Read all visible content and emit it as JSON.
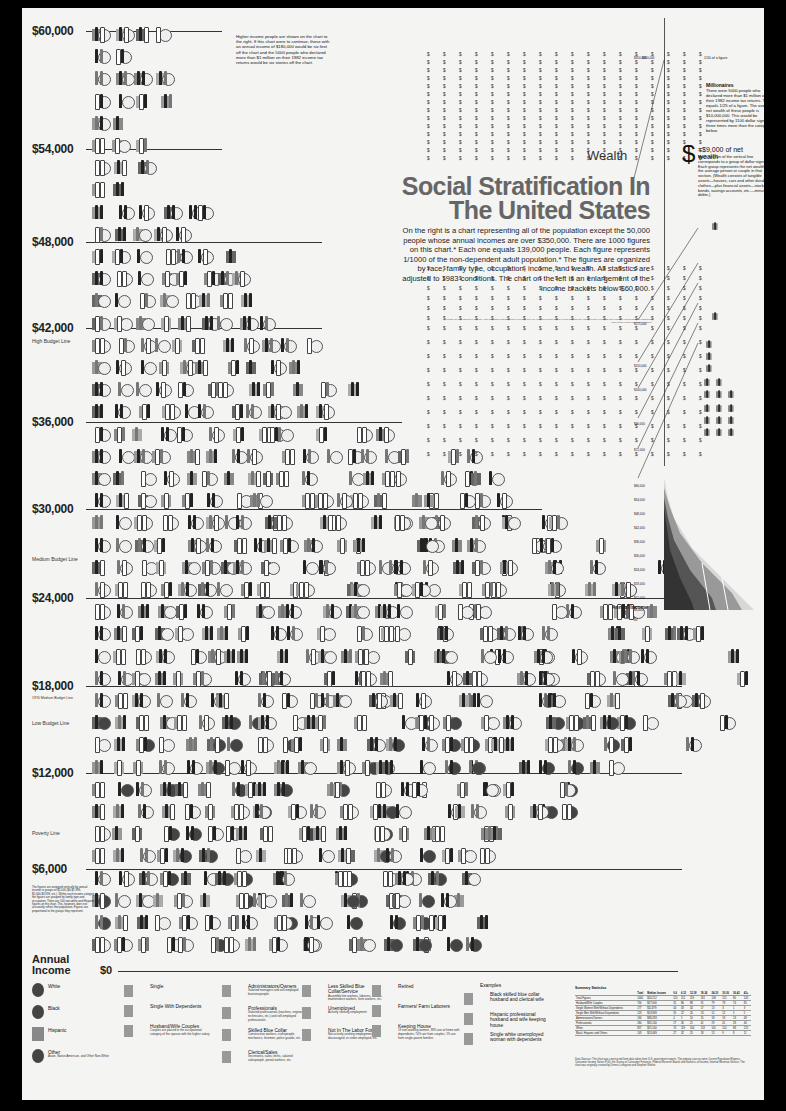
{
  "chart_data": {
    "type": "pictograph",
    "title": "Social Stratification In The United States",
    "subtitle": "On the right is a chart representing all of the population except the 50,000 people whose annual incomes are over $350,000. There are 1000 figures on this chart.* Each one equals 139,000 people. Each figure represents 1/1000 of the non-dependent adult population.* The figures are organized by race, family type, occupation, income, and wealth. All statistics are adjusted to 1983 conditions. The chart on the left is an enlargement of the income brackets below $60,000.",
    "ylabel": "Annual Income",
    "y_ticks": [
      "$0",
      "$6,000",
      "$12,000",
      "$18,000",
      "$24,000",
      "$30,000",
      "$36,000",
      "$42,000",
      "$48,000",
      "$54,000",
      "$60,000"
    ],
    "ylim": [
      0,
      60000
    ],
    "reference_lines": [
      {
        "label": "High Budget Line",
        "value": 41000
      },
      {
        "label": "Medium Budget Line",
        "value": 27000
      },
      {
        "label": "1970 Medium Budget Line",
        "value": 17500
      },
      {
        "label": "Low Budget Line",
        "value": 16500
      },
      {
        "label": "Poverty Line",
        "value": 9500
      }
    ],
    "figures_per_row_by_bracket": [
      {
        "income_row": "$58,000-60,000",
        "count": 4
      },
      {
        "income_row": "$54,000-56,000",
        "count": 4
      },
      {
        "income_row": "$48,000-50,000",
        "count": 7
      },
      {
        "income_row": "$42,000-44,000",
        "count": 10
      },
      {
        "income_row": "$36,000-38,000",
        "count": 12
      },
      {
        "income_row": "$30,000-32,000",
        "count": 17
      },
      {
        "income_row": "$24,000-26,000",
        "count": 22
      },
      {
        "income_row": "$18,000-20,000",
        "count": 25
      },
      {
        "income_row": "$12,000-14,000",
        "count": 28
      },
      {
        "income_row": "$6,000-8,000",
        "count": 24
      },
      {
        "income_row": "$0-2,000",
        "count": 18
      }
    ],
    "wealth_axis_ticks": [
      "$0",
      "$6,000",
      "$12,000",
      "$18,000",
      "$24,000",
      "$30,000",
      "$36,000",
      "$42,000",
      "$48,000",
      "$54,000",
      "$60,000",
      "$72,000",
      "$90,000",
      "$100,000",
      "$150,000",
      "$175,000",
      "$350,000"
    ],
    "wealth_unit": "$ = $9,000 of net wealth"
  },
  "poster": {
    "wealth_label": "Wealth",
    "dollar_row": "$ $ $ $ $ $ $ $ $ $ $ $ $ $ $ $ $ $",
    "top_marker": "$350,000",
    "one_figure_label": "1/10 of a figure",
    "millionaires": {
      "title": "Millionaires",
      "body": "There were 5000 people who declared more than $1 million on their 1982 income tax returns. This equals 1/25 of a figure. The average net wealth of these people is $10,000,000. This would be represented by 1100 dollar signs, or three times more than the category below."
    },
    "net_wealth": {
      "symbol": "$",
      "head": "=$9,000 of net wealth",
      "body": "Each section of the vertical line corresponds to a group of dollar signs. Each group represents the net wealth of the average person or couple in that section. (Wealth consists of tangible assets—houses, cars and other durables, clothes—plus financial assets—stocks, bonds, savings accounts, etc.—minus debts.)"
    },
    "annual_income_right": "Annual Income",
    "wealth_ticks_right": [
      "$350,000",
      "$175,000",
      "$150,000",
      "$100,000",
      "$90,000",
      "$72,000",
      "$60,000",
      "$54,000",
      "$48,000",
      "$42,000",
      "$36,000",
      "$30,000",
      "$24,000",
      "$18,000",
      "$12,000",
      "$6,000",
      "$0"
    ],
    "footnote": "*These are real figures in a couple. Non-dependent adults include everyone over 18 years old except children living with parents; elderly people living with their children; and persons in institutions such as the armed forces and prisons.",
    "side_note_top": "Higher income people are shown on the chart to the right. If this chart were to continue, those with an annual income of $180,000 would be six feet off the chart and the 5000 people who declared more than $1 million on their 1982 income tax returns would be six stories off the chart.",
    "side_note_bottom": "The figures are arranged vertically by annual income in groups of $2,000 ($0-$1,999, $2,000-$3,999, etc.). Within each income category the figures are grouped by family type and occupation. There are 100 non-white and Hispanic figures on the chart. This, however, does not accurately reflect that population. Figures are proportional to the groups they represent.",
    "annual_income_left": "Annual Income",
    "zero_label": "$0",
    "y_labels": [
      {
        "label": "$60,000",
        "top": 16
      },
      {
        "label": "$54,000",
        "top": 134
      },
      {
        "label": "$48,000",
        "top": 227
      },
      {
        "label": "$42,000",
        "top": 313
      },
      {
        "label": "$36,000",
        "top": 407
      },
      {
        "label": "$30,000",
        "top": 494
      },
      {
        "label": "$24,000",
        "top": 583
      },
      {
        "label": "$18,000",
        "top": 671
      },
      {
        "label": "$12,000",
        "top": 758
      },
      {
        "label": "$6,000",
        "top": 854
      }
    ],
    "budget_labels": {
      "high": "High Budget Line",
      "medium": "Medium Budget Line",
      "medium_1970": "1970 Medium Budget Line",
      "low": "Low Budget Line",
      "poverty": "Poverty Line"
    }
  },
  "legend": {
    "race": [
      {
        "label": "White"
      },
      {
        "label": "Black"
      },
      {
        "label": "Hispanic"
      },
      {
        "label": "Other",
        "sub": "Asian, Native American, and Other Non-White"
      }
    ],
    "family": [
      {
        "label": "Single"
      },
      {
        "label": "Single With Dependents"
      },
      {
        "label": "Husband/Wife Couples",
        "sub": "Couples are placed in the occupational category of the spouse with the higher salary"
      }
    ],
    "occupation_a": [
      {
        "label": "Administrators/Owners",
        "sub": "Salaried managers and self-employed businesspeople"
      },
      {
        "label": "Professionals",
        "sub": "Salaried professionals (teachers, engineers, technicians, etc.) and self-employed professionals"
      },
      {
        "label": "Skilled Blue Collar",
        "sub": "Construction workers, craftspeople, mechanics, foremen, police guards, etc."
      },
      {
        "label": "Clerical/Sales",
        "sub": "Secretaries, sales clerks, salaried salespeople, postal workers, etc."
      }
    ],
    "occupation_b": [
      {
        "label": "Less Skilled Blue Collar/Service",
        "sub": "Assembly line workers, laborers, waiters, maintenance workers, farm workers, etc."
      },
      {
        "label": "Unemployed",
        "sub": "Actively seeking employment"
      },
      {
        "label": "Not In The Labor Force",
        "sub": "Not actively seeking employment, discouraged, or under-employed, etc."
      }
    ],
    "other": [
      {
        "label": "Retired"
      },
      {
        "label": "Farmers/ Farm Laborers"
      },
      {
        "label": "Keeping House",
        "sub": "Of non-working women, 38% are at home with dependents; 74% are from couples; 1% are from single-parent families"
      }
    ],
    "examples": {
      "title": "Examples",
      "items": [
        {
          "label": "Black skilled blue collar husband and clerical wife"
        },
        {
          "label": "Hispanic professional husband and wife keeping house"
        },
        {
          "label": "Single white unemployed woman with dependents"
        }
      ]
    }
  },
  "summary": {
    "title": "Summary Statistics",
    "headers": [
      "",
      "Total",
      "Median Income",
      "0-6",
      "6-12",
      "12-18",
      "18-24",
      "24-30",
      "30-36",
      "36-42",
      "42+"
    ],
    "rows": [
      [
        "Total Figures",
        "1000",
        "$20,212",
        "110",
        "151",
        "119",
        "161",
        "109",
        "115",
        "80",
        "145"
      ],
      [
        "Husband/Wife Couples",
        "700",
        "$27,000",
        "31",
        "86",
        "88",
        "91",
        "79",
        "78",
        "74",
        "85"
      ],
      [
        "Single Women With/Without Dependents",
        "177",
        "$11,879",
        "44",
        "43",
        "34",
        "17",
        "13",
        "3",
        "1",
        "3"
      ],
      [
        "Single Men With/Without Dependents",
        "123",
        "$13,969",
        "35",
        "22",
        "20",
        "13",
        "12",
        "12",
        "5",
        "5"
      ],
      [
        "Administrators/Owners",
        "194",
        "$36,283",
        "4",
        "5",
        "10",
        "15",
        "18",
        "19",
        "13",
        "48"
      ],
      [
        "Professionals",
        "260",
        "$31,100",
        "17",
        "26",
        "21",
        "41",
        "29",
        "41",
        "28",
        "46"
      ],
      [
        "White",
        "857",
        "$21,100",
        "74",
        "119",
        "104",
        "113",
        "101",
        "114",
        "88",
        "125"
      ],
      [
        "Black, Hispanic and Others",
        "143",
        "$13,469",
        "27",
        "32",
        "25",
        "18",
        "13",
        "9",
        "8",
        "11"
      ]
    ]
  },
  "data_sources": "Data Sources: The chart was constructed from data taken from U.S. government reports. The primary sources were Current Population Reports, Consumer Income Series P-60; the Survey of Consumer Finances, Federal Reserve Board; and Statistics of Income, Internal Revenue Service. The chart was originally created by Dennis Livingston and Stephen Wexler."
}
